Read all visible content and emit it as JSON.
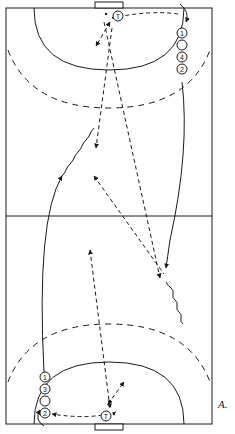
{
  "figure": {
    "label": "A.",
    "type": "handball-court-drill-diagram"
  },
  "court": {
    "line_color": "#1a1a1a",
    "background": "#ffffff"
  },
  "players": {
    "top_queue": [
      {
        "label": "1"
      },
      {
        "label": ""
      },
      {
        "label": "4"
      },
      {
        "label": "2"
      }
    ],
    "bottom_queue": [
      {
        "label": "1"
      },
      {
        "label": "3"
      },
      {
        "label": ""
      },
      {
        "label": "2"
      }
    ],
    "top_goalkeeper": {
      "label": "T"
    },
    "bottom_goalkeeper": {
      "label": "T"
    }
  },
  "legend_icons": {
    "pass": "dashed-arrow",
    "run": "solid-arrow",
    "dribble": "wavy-line"
  }
}
